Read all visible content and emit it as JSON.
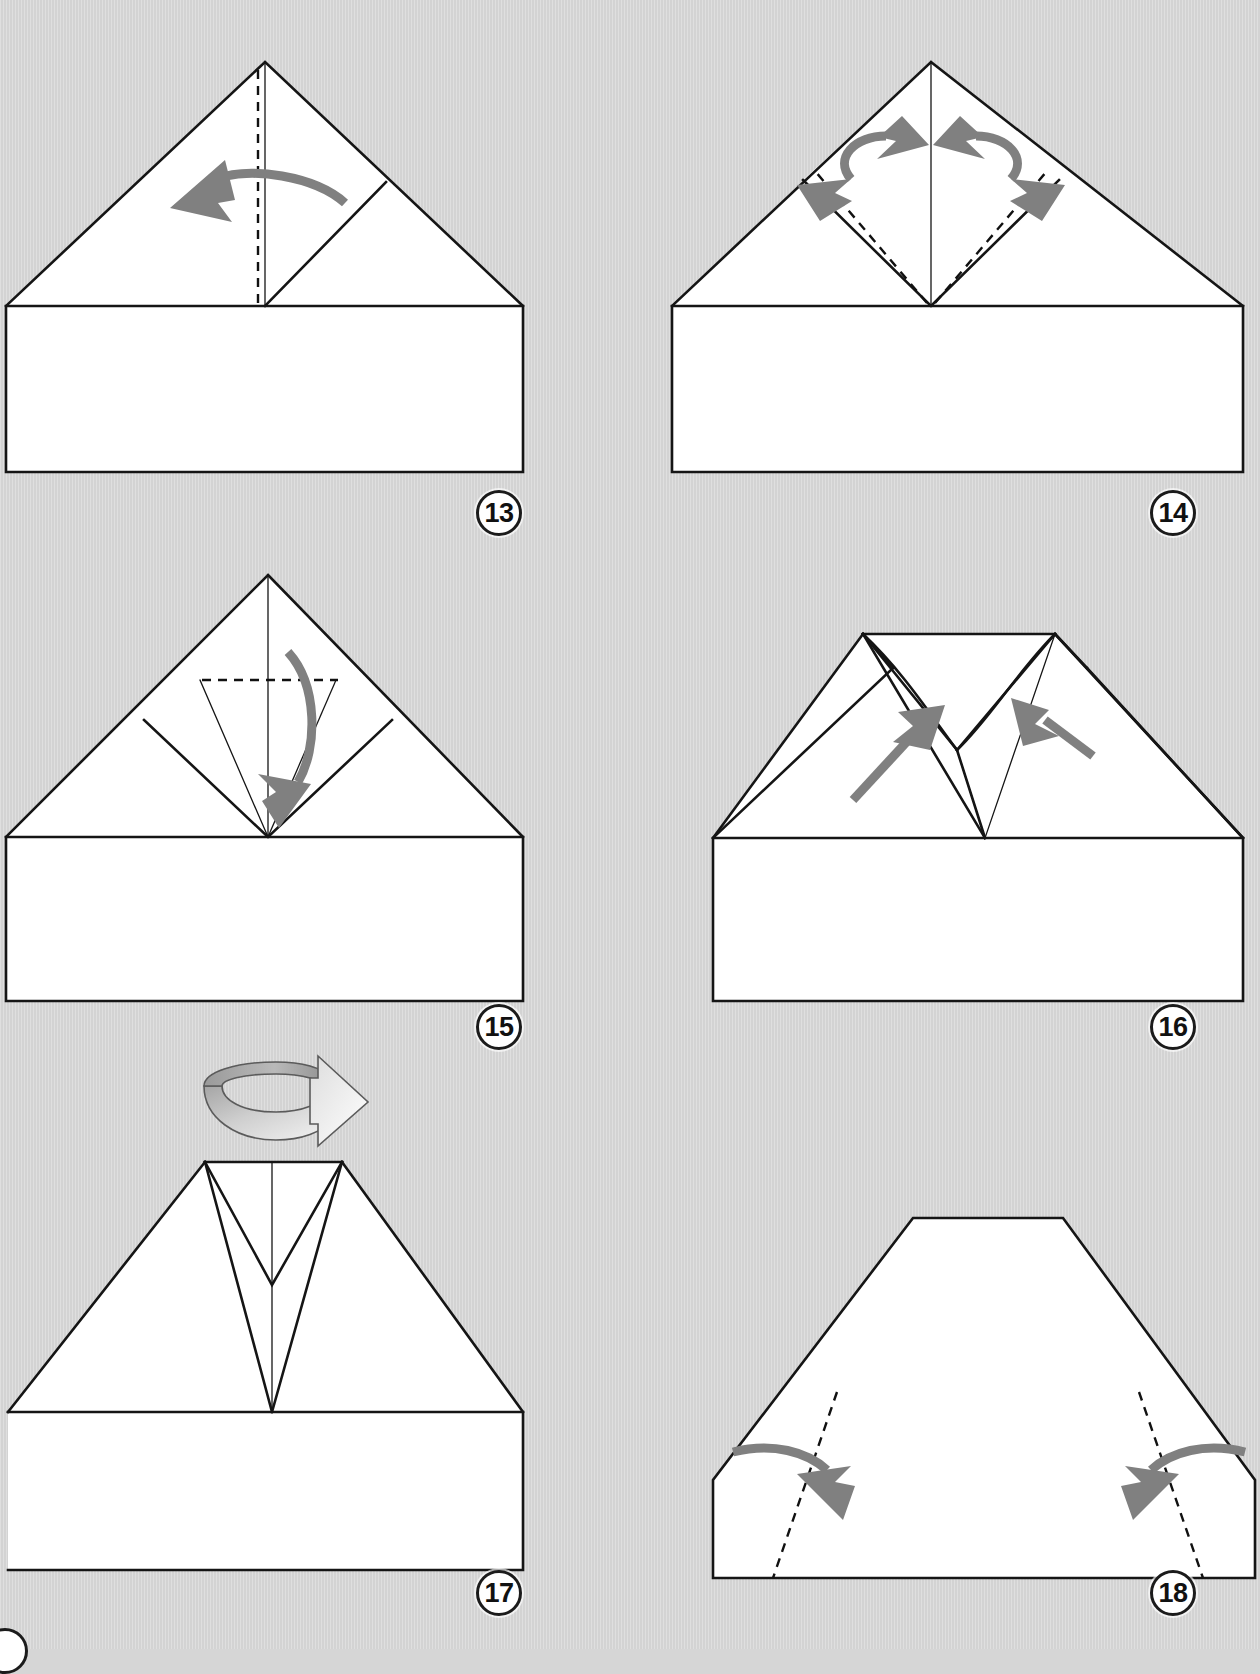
{
  "document": {
    "title": "Origami Paper Airplane Folding Instructions",
    "kind": "step-by-step folding diagram sheet",
    "background_color": "#d6d6d6",
    "paper_color": "#ffffff",
    "line_color": "#151515",
    "arrow_color": "#808080"
  },
  "sheet": {
    "columns": 2,
    "rows": 3,
    "step_range": "13-18"
  },
  "steps": [
    {
      "number": "13",
      "badge_label": "13",
      "position": "top-left",
      "shape": "house (triangle roof over rectangle body) with small folded flap on right side",
      "creases": [
        "vertical dashed center line from apex to base of roof"
      ],
      "arrows": [
        {
          "type": "curved",
          "direction": "right-to-left",
          "meaning": "fold flap over to the left"
        }
      ]
    },
    {
      "number": "14",
      "badge_label": "14",
      "position": "top-right",
      "shape": "house with both top flaps folded down forming a diamond at the apex",
      "creases": [
        "two dashed lines from center base point up to the outer flap corners"
      ],
      "arrows": [
        {
          "type": "curved-double-headed",
          "direction": "left-pair",
          "meaning": "open and flatten the left pocket"
        },
        {
          "type": "curved-double-headed",
          "direction": "right-pair",
          "meaning": "open and flatten the right pocket"
        }
      ]
    },
    {
      "number": "15",
      "badge_label": "15",
      "position": "middle-left",
      "shape": "house with squashed diamond top showing thin interior crease lines radiating from center base point",
      "creases": [
        "horizontal dashed line across the upper triangle"
      ],
      "arrows": [
        {
          "type": "curved",
          "direction": "downward",
          "meaning": "fold the top point down to the center"
        }
      ]
    },
    {
      "number": "16",
      "badge_label": "16",
      "position": "middle-right",
      "shape": "house with flattened top edge and narrow V pocket in the center",
      "creases": [],
      "arrows": [
        {
          "type": "straight",
          "direction": "up-right from lower-left",
          "meaning": "push the left side inward"
        },
        {
          "type": "straight",
          "direction": "up-left from lower-right",
          "meaning": "push the right side inward"
        }
      ]
    },
    {
      "number": "17",
      "badge_label": "17",
      "position": "bottom-left",
      "shape": "flipped model: wide trapezoid top with a central V-shaped pocket pointing down to the base center",
      "creases": [
        "faint vertical center line inside the V"
      ],
      "arrows": [],
      "symbol": {
        "name": "flip-over-symbol",
        "meaning": "turn the model over",
        "style": "curled ribbon with arrowhead pointing right, gradient shaded"
      }
    },
    {
      "number": "18",
      "badge_label": "18",
      "position": "bottom-right",
      "shape": "pentagon / trapezoid outline — flat back of the model",
      "creases": [
        "left dashed line from upper-left slant down to bottom-left corner",
        "right dashed line from upper-right slant down to bottom-right corner"
      ],
      "arrows": [
        {
          "type": "curved",
          "direction": "left-to-right inward",
          "meaning": "fold the left side in along the dashed line"
        },
        {
          "type": "curved",
          "direction": "right-to-left inward",
          "meaning": "fold the right side in along the dashed line"
        }
      ]
    }
  ],
  "partial_badge": {
    "visible": true,
    "note": "clipped step badge at the bottom-left edge of the sheet"
  }
}
